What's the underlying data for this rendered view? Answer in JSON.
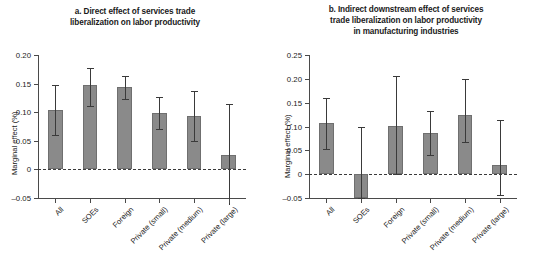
{
  "figure": {
    "background": "#ffffff",
    "bar_color": "#8a8a8a",
    "bar_edge_color": "#6f6f6f",
    "error_color": "#3a3a3a",
    "axis_color": "#4a4a4a"
  },
  "chart_data": [
    {
      "type": "bar",
      "panel": "a",
      "title": "a. Direct effect of services trade liberalization on labor productivity",
      "title_lines": [
        "a. Direct effect of services trade",
        "liberalization on labor productivity"
      ],
      "xlabel": "",
      "ylabel": "Marginal effect (%)",
      "ylim": [
        -0.05,
        0.2
      ],
      "yticks": [
        -0.05,
        0,
        0.05,
        0.1,
        0.15,
        0.2
      ],
      "ytick_labels": [
        "–0.05",
        "0",
        "0.05",
        "0.10",
        "0.15",
        "0.20"
      ],
      "grid": false,
      "legend": "none",
      "zero_line": true,
      "categories": [
        "All",
        "SOEs",
        "Foreign",
        "Private (small)",
        "Private (medium)",
        "Private (large)"
      ],
      "values": [
        0.104,
        0.147,
        0.144,
        0.099,
        0.093,
        0.025
      ],
      "error_low": [
        0.061,
        0.111,
        0.123,
        0.071,
        0.049,
        -0.062
      ],
      "error_high": [
        0.147,
        0.178,
        0.164,
        0.127,
        0.137,
        0.115
      ]
    },
    {
      "type": "bar",
      "panel": "b",
      "title": "b. Indirect downstream effect of services trade liberalization on labor productivity in manufacturing industries",
      "title_lines": [
        "b. Indirect downstream effect of services",
        "trade liberalization on labor productivity",
        "in manufacturing industries"
      ],
      "xlabel": "",
      "ylabel": "Marginal effect (%)",
      "ylim": [
        -0.05,
        0.25
      ],
      "yticks": [
        -0.05,
        0,
        0.05,
        0.1,
        0.15,
        0.2,
        0.25
      ],
      "ytick_labels": [
        "–0.05",
        "0",
        "0.05",
        "0.10",
        "0.15",
        "0.20",
        "0.25"
      ],
      "grid": false,
      "legend": "none",
      "zero_line": true,
      "categories": [
        "All",
        "SOEs",
        "Foreign",
        "Private (small)",
        "Private (medium)",
        "Private (large)"
      ],
      "values": [
        0.108,
        -0.049,
        0.102,
        0.087,
        0.125,
        0.02
      ],
      "error_low": [
        0.053,
        -0.05,
        0.001,
        0.041,
        0.067,
        -0.044
      ],
      "error_high": [
        0.16,
        0.098,
        0.205,
        0.132,
        0.199,
        0.113
      ]
    }
  ]
}
